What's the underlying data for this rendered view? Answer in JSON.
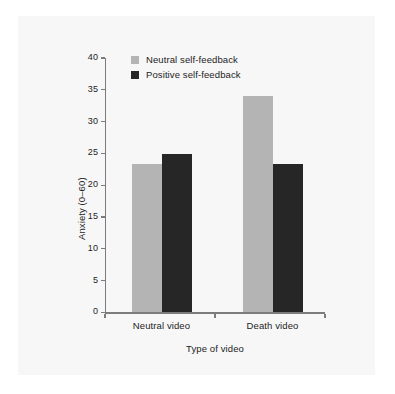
{
  "chart_data": {
    "type": "bar",
    "title": "",
    "xlabel": "Type of video",
    "ylabel": "Anxiety (0–60)",
    "categories": [
      "Neutral video",
      "Death video"
    ],
    "series": [
      {
        "name": "Neutral self-feedback",
        "color": "#b4b4b4",
        "values": [
          23.3,
          34.1
        ]
      },
      {
        "name": "Positive self-feedback",
        "color": "#262626",
        "values": [
          24.9,
          23.3
        ]
      }
    ],
    "ylim": [
      0,
      40
    ],
    "yticks": [
      0,
      5,
      10,
      15,
      20,
      25,
      30,
      35,
      40
    ],
    "ytick_labels": [
      "0",
      "5",
      "10",
      "15",
      "20",
      "25",
      "30",
      "35",
      "40"
    ],
    "grid": false,
    "legend_position": "top-left-inside",
    "axis_color": "#7c7c7c",
    "background": "#f7f7f7"
  },
  "legend": {
    "items": [
      {
        "label": "Neutral self-feedback"
      },
      {
        "label": "Positive self-feedback"
      }
    ]
  }
}
